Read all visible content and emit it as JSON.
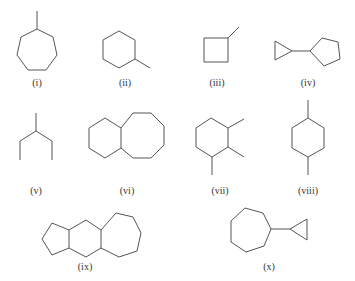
{
  "figure": {
    "line_color": "#555555",
    "label_color": "#333333",
    "structures": [
      {
        "label": "(i)",
        "name": "methylcycloheptane",
        "label_pos": [
          37,
          78
        ],
        "paths": [
          {
            "points": [
              [
                37,
                29
              ],
              [
                53,
                37
              ],
              [
                57,
                55
              ],
              [
                46,
                70
              ],
              [
                28,
                70
              ],
              [
                17,
                55
              ],
              [
                21,
                37
              ]
            ],
            "closed": true
          },
          {
            "points": [
              [
                37,
                29
              ],
              [
                37,
                11
              ]
            ],
            "closed": false
          }
        ]
      },
      {
        "label": "(ii)",
        "name": "methylcyclohexane",
        "label_pos": [
          125,
          78
        ],
        "paths": [
          {
            "points": [
              [
                119,
                31
              ],
              [
                135,
                40
              ],
              [
                135,
                59
              ],
              [
                119,
                68
              ],
              [
                103,
                59
              ],
              [
                103,
                40
              ]
            ],
            "closed": true
          },
          {
            "points": [
              [
                135,
                59
              ],
              [
                150,
                68
              ]
            ],
            "closed": false
          }
        ]
      },
      {
        "label": "(iii)",
        "name": "methylcyclobutane",
        "label_pos": [
          217,
          78
        ],
        "paths": [
          {
            "points": [
              [
                204,
                38
              ],
              [
                228,
                38
              ],
              [
                228,
                62
              ],
              [
                204,
                62
              ]
            ],
            "closed": true
          },
          {
            "points": [
              [
                228,
                38
              ],
              [
                239,
                27
              ]
            ],
            "closed": false
          }
        ]
      },
      {
        "label": "(iv)",
        "name": "cyclopropylcyclopentane",
        "label_pos": [
          308,
          78
        ],
        "paths": [
          {
            "points": [
              [
                275,
                41
              ],
              [
                275,
                60
              ],
              [
                292,
                51
              ]
            ],
            "closed": true
          },
          {
            "points": [
              [
                292,
                51
              ],
              [
                310,
                51
              ]
            ],
            "closed": false
          },
          {
            "points": [
              [
                310,
                51
              ],
              [
                322,
                38
              ],
              [
                338,
                42
              ],
              [
                340,
                59
              ],
              [
                324,
                66
              ]
            ],
            "closed": true
          }
        ]
      },
      {
        "label": "(v)",
        "name": "3-methylpentane",
        "label_pos": [
          36,
          186
        ],
        "paths": [
          {
            "points": [
              [
                36,
                113
              ],
              [
                36,
                131
              ]
            ],
            "closed": false
          },
          {
            "points": [
              [
                20,
                160
              ],
              [
                20,
                141
              ],
              [
                36,
                131
              ],
              [
                52,
                141
              ],
              [
                52,
                160
              ]
            ],
            "closed": false
          }
        ]
      },
      {
        "label": "(vi)",
        "name": "bicyclo[6.4.0]dodecane",
        "label_pos": [
          127,
          186
        ],
        "paths": [
          {
            "points": [
              [
                121,
                128
              ],
              [
                105,
                118
              ],
              [
                89,
                128
              ],
              [
                89,
                148
              ],
              [
                105,
                158
              ],
              [
                121,
                148
              ]
            ],
            "closed": true
          },
          {
            "points": [
              [
                121,
                128
              ],
              [
                133,
                113
              ],
              [
                151,
                113
              ],
              [
                164,
                126
              ],
              [
                164,
                145
              ],
              [
                151,
                158
              ],
              [
                133,
                158
              ],
              [
                121,
                148
              ]
            ],
            "closed": false
          }
        ]
      },
      {
        "label": "(vii)",
        "name": "1,2,3-trimethylcyclohexane",
        "label_pos": [
          220,
          186
        ],
        "paths": [
          {
            "points": [
              [
                211,
                118
              ],
              [
                228,
                128
              ],
              [
                228,
                147
              ],
              [
                212,
                157
              ],
              [
                196,
                147
              ],
              [
                196,
                128
              ]
            ],
            "closed": true
          },
          {
            "points": [
              [
                228,
                128
              ],
              [
                244,
                119
              ]
            ],
            "closed": false
          },
          {
            "points": [
              [
                228,
                147
              ],
              [
                244,
                157
              ]
            ],
            "closed": false
          },
          {
            "points": [
              [
                212,
                157
              ],
              [
                212,
                175
              ]
            ],
            "closed": false
          }
        ]
      },
      {
        "label": "(viii)",
        "name": "1,4-dimethylcyclohexane",
        "label_pos": [
          308,
          186
        ],
        "paths": [
          {
            "points": [
              [
                308,
                118
              ],
              [
                324,
                128
              ],
              [
                324,
                148
              ],
              [
                308,
                157
              ],
              [
                292,
                148
              ],
              [
                292,
                128
              ]
            ],
            "closed": true
          },
          {
            "points": [
              [
                308,
                118
              ],
              [
                308,
                100
              ]
            ],
            "closed": false
          },
          {
            "points": [
              [
                308,
                157
              ],
              [
                308,
                175
              ]
            ],
            "closed": false
          }
        ]
      },
      {
        "label": "(ix)",
        "name": "5-6-7 fused tricyclic alkane",
        "label_pos": [
          85,
          262
        ],
        "paths": [
          {
            "points": [
              [
                69,
                230
              ],
              [
                52,
                223
              ],
              [
                42,
                239
              ],
              [
                52,
                255
              ],
              [
                69,
                248
              ]
            ],
            "closed": false
          },
          {
            "points": [
              [
                69,
                230
              ],
              [
                86,
                220
              ],
              [
                101,
                230
              ],
              [
                101,
                248
              ],
              [
                86,
                257
              ],
              [
                69,
                248
              ]
            ],
            "closed": true
          },
          {
            "points": [
              [
                101,
                230
              ],
              [
                116,
                213
              ],
              [
                133,
                217
              ],
              [
                141,
                233
              ],
              [
                137,
                251
              ],
              [
                119,
                257
              ],
              [
                101,
                248
              ]
            ],
            "closed": false
          }
        ]
      },
      {
        "label": "(x)",
        "name": "cyclopropylcycloheptane",
        "label_pos": [
          269,
          262
        ],
        "paths": [
          {
            "points": [
              [
                245,
                208
              ],
              [
                263,
                213
              ],
              [
                271,
                229
              ],
              [
                264,
                246
              ],
              [
                246,
                252
              ],
              [
                231,
                242
              ],
              [
                231,
                221
              ]
            ],
            "closed": true
          },
          {
            "points": [
              [
                271,
                229
              ],
              [
                290,
                229
              ]
            ],
            "closed": false
          },
          {
            "points": [
              [
                290,
                229
              ],
              [
                307,
                219
              ],
              [
                307,
                240
              ]
            ],
            "closed": true
          }
        ]
      }
    ]
  }
}
